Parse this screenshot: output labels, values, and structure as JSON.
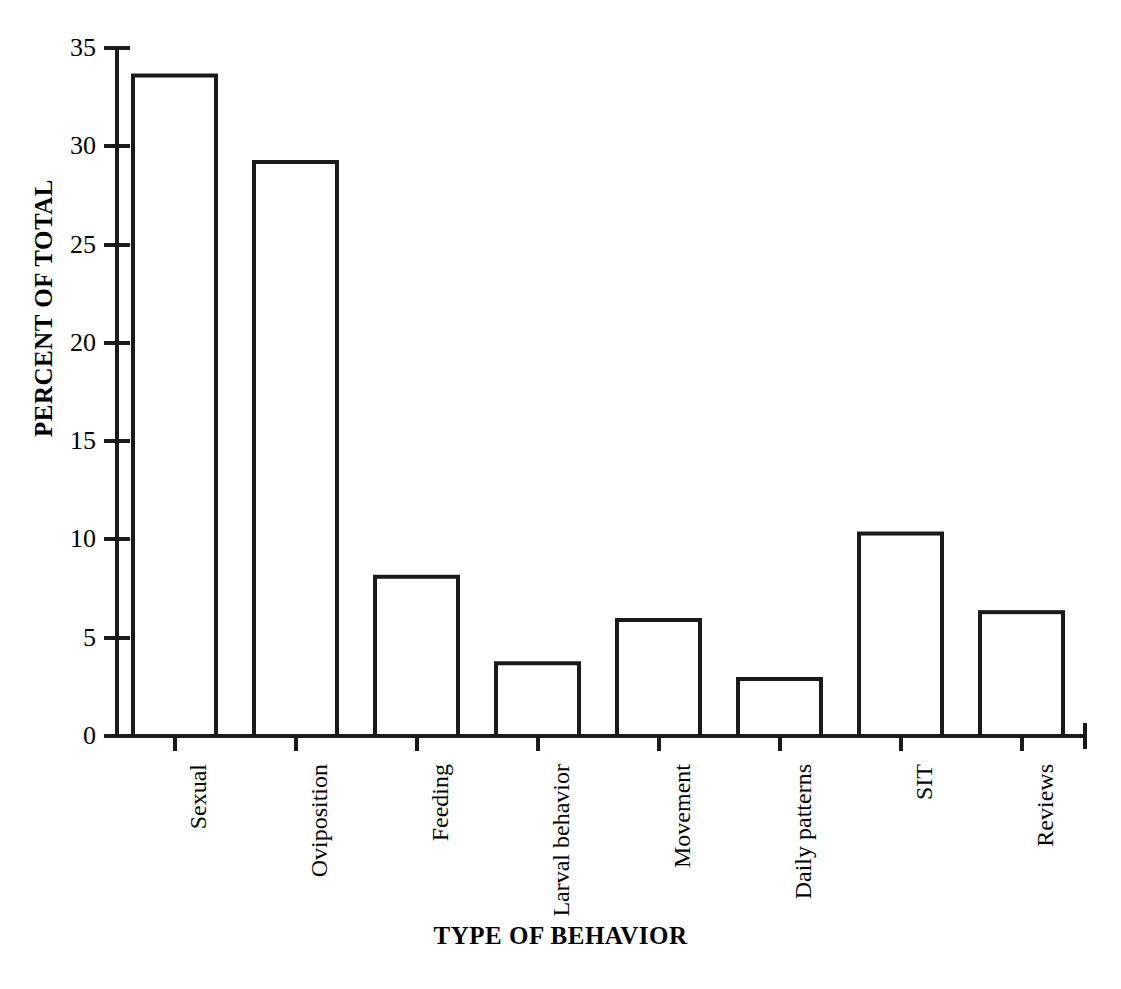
{
  "chart_data": {
    "type": "bar",
    "title": "",
    "xlabel": "TYPE OF BEHAVIOR",
    "ylabel": "PERCENT OF TOTAL",
    "categories": [
      "Sexual",
      "Oviposition",
      "Feeding",
      "Larval behavior",
      "Movement",
      "Daily patterns",
      "SIT",
      "Reviews"
    ],
    "values": [
      33.6,
      29.2,
      8.1,
      3.7,
      5.9,
      2.9,
      10.3,
      6.3
    ],
    "ylim": [
      0,
      35
    ],
    "yticks": [
      0,
      5,
      10,
      15,
      20,
      25,
      30,
      35
    ],
    "ytick_labels": [
      "0",
      "5",
      "10",
      "15",
      "20",
      "25",
      "30",
      "35"
    ],
    "grid": false,
    "legend": false,
    "legend_position": "none",
    "bar_style": {
      "fill": "#ffffff",
      "edge_color": "#1a1a1a",
      "edge_width": 4
    },
    "axis_color": "#1a1a1a",
    "background": "#ffffff"
  }
}
